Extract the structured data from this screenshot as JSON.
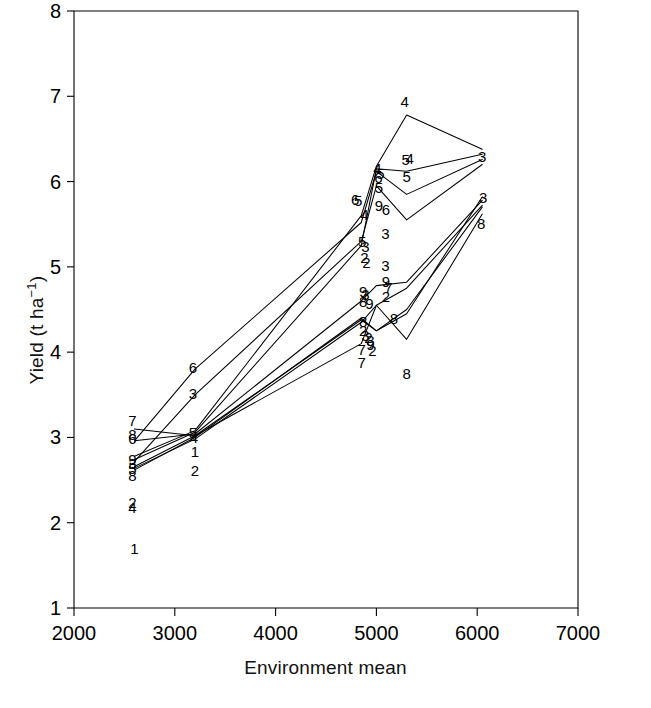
{
  "figure": {
    "background": "#ffffff",
    "line_color": "#000000",
    "label_color": "#000000"
  },
  "axes": {
    "x_title": "Environment mean",
    "y_title_main": "Yield (t ha",
    "y_title_sup": "−1",
    "y_title_tail": ")",
    "y_title_plain": "Yield (t ha−1)"
  },
  "chart_data": {
    "type": "line",
    "title": "",
    "subtitle": "",
    "xlabel": "Environment mean",
    "ylabel": "Yield (t ha−1)",
    "xlim": [
      2000,
      7000
    ],
    "ylim": [
      1,
      8
    ],
    "xticks": [
      2000,
      3000,
      4000,
      5000,
      6000,
      7000
    ],
    "xticklabels": [
      "2000",
      "3000",
      "4000",
      "5000",
      "6000",
      "7000"
    ],
    "yticks": [
      1,
      2,
      3,
      4,
      5,
      6,
      7,
      8
    ],
    "yticklabels": [
      "1",
      "2",
      "3",
      "4",
      "5",
      "6",
      "7",
      "8"
    ],
    "grid": false,
    "legend": "none",
    "marker_style": "numeric-genotype-label",
    "x": [
      2600,
      3200,
      4850,
      5000,
      5300,
      6050
    ],
    "series": [
      {
        "name": "1",
        "values": [
          2.62,
          3.0,
          4.4,
          4.25,
          4.5,
          5.7
        ]
      },
      {
        "name": "2",
        "values": [
          2.66,
          3.02,
          4.38,
          4.25,
          4.45,
          5.82
        ]
      },
      {
        "name": "3",
        "values": [
          2.72,
          3.5,
          5.3,
          5.95,
          5.55,
          6.2
        ]
      },
      {
        "name": "4",
        "values": [
          2.78,
          3.08,
          5.6,
          6.18,
          6.78,
          6.38
        ]
      },
      {
        "name": "5",
        "values": [
          2.74,
          3.06,
          5.25,
          6.15,
          6.12,
          6.32
        ]
      },
      {
        "name": "6",
        "values": [
          2.96,
          3.8,
          5.52,
          6.12,
          5.85,
          6.26
        ]
      },
      {
        "name": "7",
        "values": [
          3.1,
          3.02,
          4.1,
          4.55,
          4.75,
          5.72
        ]
      },
      {
        "name": "8",
        "values": [
          2.64,
          2.98,
          4.35,
          4.55,
          4.15,
          5.62
        ]
      },
      {
        "name": "9",
        "values": [
          2.96,
          3.04,
          4.6,
          4.78,
          4.82,
          5.78
        ]
      }
    ],
    "point_labels": [
      {
        "text": "7",
        "x": 2580,
        "y": 3.2
      },
      {
        "text": "8",
        "x": 2580,
        "y": 3.04
      },
      {
        "text": "6",
        "x": 2580,
        "y": 2.99
      },
      {
        "text": "9",
        "x": 2580,
        "y": 2.75
      },
      {
        "text": "3",
        "x": 2580,
        "y": 2.7
      },
      {
        "text": "5",
        "x": 2580,
        "y": 2.64
      },
      {
        "text": "8",
        "x": 2580,
        "y": 2.56
      },
      {
        "text": "2",
        "x": 2580,
        "y": 2.24
      },
      {
        "text": "4",
        "x": 2580,
        "y": 2.18
      },
      {
        "text": "1",
        "x": 2600,
        "y": 1.7
      },
      {
        "text": "6",
        "x": 3180,
        "y": 3.82
      },
      {
        "text": "3",
        "x": 3180,
        "y": 3.52
      },
      {
        "text": "5",
        "x": 3180,
        "y": 3.06
      },
      {
        "text": "4",
        "x": 3190,
        "y": 3.0
      },
      {
        "text": "1",
        "x": 3200,
        "y": 2.84
      },
      {
        "text": "2",
        "x": 3200,
        "y": 2.62
      },
      {
        "text": "6",
        "x": 4790,
        "y": 5.8
      },
      {
        "text": "5",
        "x": 4820,
        "y": 5.78
      },
      {
        "text": "4",
        "x": 4880,
        "y": 5.62
      },
      {
        "text": "5",
        "x": 4860,
        "y": 5.3
      },
      {
        "text": "3",
        "x": 4890,
        "y": 5.25
      },
      {
        "text": "2",
        "x": 4880,
        "y": 5.12
      },
      {
        "text": "2",
        "x": 4900,
        "y": 5.06
      },
      {
        "text": "9",
        "x": 4870,
        "y": 4.72
      },
      {
        "text": "3",
        "x": 4890,
        "y": 4.68
      },
      {
        "text": "8",
        "x": 4870,
        "y": 4.6
      },
      {
        "text": "9",
        "x": 4930,
        "y": 4.58
      },
      {
        "text": "8",
        "x": 4870,
        "y": 4.36
      },
      {
        "text": "9",
        "x": 4940,
        "y": 4.1
      },
      {
        "text": "2",
        "x": 4870,
        "y": 4.26
      },
      {
        "text": "3",
        "x": 4890,
        "y": 4.2
      },
      {
        "text": "7",
        "x": 4855,
        "y": 4.04
      },
      {
        "text": "7",
        "x": 4855,
        "y": 3.88
      },
      {
        "text": "2",
        "x": 4920,
        "y": 4.18
      },
      {
        "text": "3",
        "x": 4940,
        "y": 4.14
      },
      {
        "text": "2",
        "x": 4960,
        "y": 4.02
      },
      {
        "text": "6",
        "x": 5020,
        "y": 6.05
      },
      {
        "text": "5",
        "x": 5040,
        "y": 6.1
      },
      {
        "text": "4",
        "x": 5010,
        "y": 6.16
      },
      {
        "text": "5",
        "x": 5025,
        "y": 5.94
      },
      {
        "text": "9",
        "x": 5025,
        "y": 5.72
      },
      {
        "text": "6",
        "x": 5095,
        "y": 5.68
      },
      {
        "text": "3",
        "x": 5090,
        "y": 5.4
      },
      {
        "text": "3",
        "x": 5090,
        "y": 5.02
      },
      {
        "text": "9",
        "x": 5095,
        "y": 4.84
      },
      {
        "text": "7",
        "x": 5120,
        "y": 4.76
      },
      {
        "text": "2",
        "x": 5095,
        "y": 4.66
      },
      {
        "text": "8",
        "x": 5175,
        "y": 4.4
      },
      {
        "text": "4",
        "x": 5280,
        "y": 6.95
      },
      {
        "text": "4",
        "x": 5330,
        "y": 6.28
      },
      {
        "text": "5",
        "x": 5290,
        "y": 6.26
      },
      {
        "text": "5",
        "x": 5300,
        "y": 6.06
      },
      {
        "text": "8",
        "x": 5300,
        "y": 3.76
      },
      {
        "text": "3",
        "x": 6050,
        "y": 6.3
      },
      {
        "text": "3",
        "x": 6060,
        "y": 5.82
      },
      {
        "text": "8",
        "x": 6040,
        "y": 5.52
      }
    ]
  }
}
